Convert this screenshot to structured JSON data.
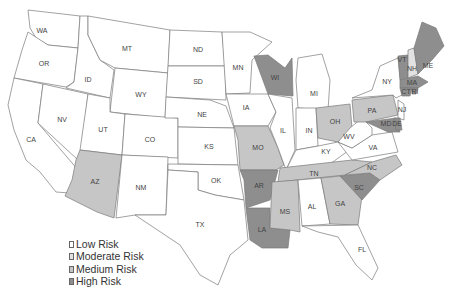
{
  "map": {
    "title": "",
    "colors": {
      "low": "#ffffff",
      "moderate": "#e2e2e2",
      "medium": "#c6c6c6",
      "high": "#8e8e8e"
    },
    "states": [
      {
        "abbr": "WA",
        "risk": "low",
        "lx": 42,
        "ly": 31,
        "points": "28,10 80,16 78,48 48,45 36,38 30,28"
      },
      {
        "abbr": "OR",
        "risk": "low",
        "lx": 44,
        "ly": 64,
        "points": "28,32 48,45 78,48 74,82 66,87 14,78 22,50"
      },
      {
        "abbr": "CA",
        "risk": "low",
        "lx": 31,
        "ly": 140,
        "points": "14,78 43,84 38,123 78,170 70,193 56,192 40,172 26,160 14,130 8,105"
      },
      {
        "abbr": "ID",
        "risk": "low",
        "lx": 88,
        "ly": 80,
        "points": "80,16 88,16 88,35 100,60 114,70 110,98 66,88 74,82 78,48"
      },
      {
        "abbr": "NV",
        "risk": "low",
        "lx": 62,
        "ly": 120,
        "points": "43,84 88,94 82,146 78,160 38,123"
      },
      {
        "abbr": "MT",
        "risk": "low",
        "lx": 127,
        "ly": 49,
        "points": "88,16 170,30 168,73 115,68 100,60 88,35"
      },
      {
        "abbr": "WY",
        "risk": "low",
        "lx": 141,
        "ly": 95,
        "points": "115,68 168,73 165,118 110,112"
      },
      {
        "abbr": "UT",
        "risk": "low",
        "lx": 103,
        "ly": 130,
        "points": "88,94 110,98 110,112 125,114 122,155 80,150"
      },
      {
        "abbr": "CO",
        "risk": "low",
        "lx": 150,
        "ly": 140,
        "points": "125,114 178,118 178,158 122,155"
      },
      {
        "abbr": "AZ",
        "risk": "medium",
        "lx": 95,
        "ly": 182,
        "points": "80,150 122,155 114,218 97,212 65,196 72,180 76,160"
      },
      {
        "abbr": "NM",
        "risk": "low",
        "lx": 141,
        "ly": 188,
        "points": "122,155 168,157 166,215 135,215 116,218"
      },
      {
        "abbr": "ND",
        "risk": "low",
        "lx": 198,
        "ly": 50,
        "points": "170,30 222,32 225,66 168,66"
      },
      {
        "abbr": "SD",
        "risk": "low",
        "lx": 198,
        "ly": 82,
        "points": "168,66 225,66 226,100 166,97"
      },
      {
        "abbr": "NE",
        "risk": "low",
        "lx": 202,
        "ly": 115,
        "points": "166,97 210,100 226,106 234,128 178,127 178,118 165,118"
      },
      {
        "abbr": "KS",
        "risk": "low",
        "lx": 209,
        "ly": 147,
        "points": "178,127 234,128 238,165 178,164"
      },
      {
        "abbr": "OK",
        "risk": "low",
        "lx": 216,
        "ly": 181,
        "points": "168,164 238,165 244,200 215,195 198,190 198,172 168,170"
      },
      {
        "abbr": "TX",
        "risk": "low",
        "lx": 200,
        "ly": 225,
        "points": "168,170 198,172 198,190 215,195 244,200 248,240 230,255 218,285 200,275 180,245 165,235 150,225 135,215 166,215"
      },
      {
        "abbr": "MN",
        "risk": "low",
        "lx": 238,
        "ly": 68,
        "points": "222,32 250,32 272,42 252,60 250,93 226,94"
      },
      {
        "abbr": "IA",
        "risk": "low",
        "lx": 246,
        "ly": 108,
        "points": "226,94 268,94 276,112 268,126 234,126"
      },
      {
        "abbr": "MO",
        "risk": "medium",
        "lx": 258,
        "ly": 148,
        "points": "234,126 268,126 278,148 284,165 276,170 240,170 238,140"
      },
      {
        "abbr": "AR",
        "risk": "high",
        "lx": 259,
        "ly": 186,
        "points": "240,170 278,170 270,200 246,208 244,180"
      },
      {
        "abbr": "LA",
        "risk": "high",
        "lx": 262,
        "ly": 230,
        "points": "246,208 270,208 270,228 290,230 288,248 262,248 250,240"
      },
      {
        "abbr": "WI",
        "risk": "high",
        "lx": 275,
        "ly": 78,
        "points": "254,56 268,55 285,68 292,58 293,96 268,94"
      },
      {
        "abbr": "IL",
        "risk": "low",
        "lx": 283,
        "ly": 131,
        "points": "268,94 292,98 295,150 286,170 278,148 270,128 276,112"
      },
      {
        "abbr": "MI",
        "risk": "low",
        "lx": 314,
        "ly": 94,
        "points": "298,58 322,54 330,80 328,110 298,108 296,80"
      },
      {
        "abbr": "IN",
        "risk": "low",
        "lx": 309,
        "ly": 131,
        "points": "296,108 316,108 318,146 296,150"
      },
      {
        "abbr": "OH",
        "risk": "medium",
        "lx": 335,
        "ly": 122,
        "points": "316,108 350,104 352,128 338,142 318,138"
      },
      {
        "abbr": "KY",
        "risk": "low",
        "lx": 326,
        "ly": 152,
        "points": "286,170 296,150 318,146 338,142 352,148 330,164 290,170"
      },
      {
        "abbr": "TN",
        "risk": "medium",
        "lx": 314,
        "ly": 174,
        "points": "280,168 352,160 372,162 345,175 278,182"
      },
      {
        "abbr": "MS",
        "risk": "medium",
        "lx": 285,
        "ly": 212,
        "points": "272,182 298,180 300,232 290,230 270,228"
      },
      {
        "abbr": "AL",
        "risk": "low",
        "lx": 312,
        "ly": 207,
        "points": "298,180 321,178 330,224 302,226"
      },
      {
        "abbr": "GA",
        "risk": "medium",
        "lx": 340,
        "ly": 204,
        "points": "321,178 340,176 362,196 358,225 330,224"
      },
      {
        "abbr": "FL",
        "risk": "low",
        "lx": 362,
        "ly": 250,
        "points": "302,226 358,225 365,240 378,268 372,280 356,265 338,237 318,232"
      },
      {
        "abbr": "SC",
        "risk": "high",
        "lx": 359,
        "ly": 188,
        "points": "340,176 370,173 380,180 362,200"
      },
      {
        "abbr": "NC",
        "risk": "medium",
        "lx": 372,
        "ly": 168,
        "points": "345,175 372,162 396,155 402,165 380,180 370,173"
      },
      {
        "abbr": "VA",
        "risk": "low",
        "lx": 373,
        "ly": 148,
        "points": "338,142 352,148 372,135 392,132 398,152 352,160"
      },
      {
        "abbr": "WV",
        "risk": "low",
        "lx": 349,
        "ly": 137,
        "points": "350,128 362,118 372,128 372,135 352,148 338,142"
      },
      {
        "abbr": "PA",
        "risk": "medium",
        "lx": 372,
        "ly": 111,
        "points": "352,100 393,95 398,115 366,122 354,122"
      },
      {
        "abbr": "NY",
        "risk": "low",
        "lx": 387,
        "ly": 82,
        "points": "352,98 372,90 380,66 398,58 402,95 396,98 393,95"
      },
      {
        "abbr": "NJ",
        "risk": "low",
        "lx": 402,
        "ly": 110,
        "points": "398,100 404,104 404,120 398,118"
      },
      {
        "abbr": "MD",
        "risk": "high",
        "lx": 386,
        "ly": 124,
        "points": "366,122 396,118 400,132 388,132"
      },
      {
        "abbr": "DE",
        "risk": "high",
        "lx": 397,
        "ly": 124,
        "points": "394,118 400,118 402,130 396,130"
      },
      {
        "abbr": "VT",
        "risk": "high",
        "lx": 402,
        "ly": 60,
        "points": "398,56 408,55 408,78 400,80"
      },
      {
        "abbr": "NH",
        "risk": "moderate",
        "lx": 412,
        "ly": 69,
        "points": "408,50 414,48 418,74 408,78"
      },
      {
        "abbr": "ME",
        "risk": "high",
        "lx": 428,
        "ly": 66,
        "points": "414,48 422,22 436,28 444,46 432,60 418,74"
      },
      {
        "abbr": "MA",
        "risk": "high",
        "lx": 412,
        "ly": 83,
        "points": "400,80 418,76 428,82 418,88 400,88"
      },
      {
        "abbr": "CT",
        "risk": "high",
        "lx": 406,
        "ly": 92,
        "points": "400,88 412,88 410,96 402,96"
      },
      {
        "abbr": "RI",
        "risk": "high",
        "lx": 415,
        "ly": 92,
        "points": "412,88 418,88 416,94 412,94"
      }
    ]
  },
  "legend": {
    "items": [
      {
        "label": "Low Risk",
        "risk": "low"
      },
      {
        "label": "Moderate Risk",
        "risk": "moderate"
      },
      {
        "label": "Medium Risk",
        "risk": "medium"
      },
      {
        "label": "High Risk",
        "risk": "high"
      }
    ]
  }
}
